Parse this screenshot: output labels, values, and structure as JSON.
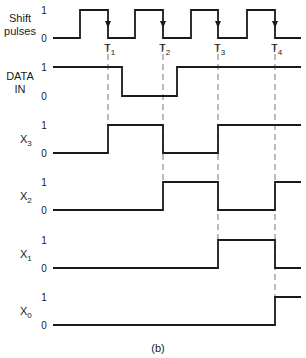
{
  "figure": {
    "caption": "(b)",
    "time_markers": [
      {
        "label": "T",
        "sub": "1",
        "x": 108
      },
      {
        "label": "T",
        "sub": "2",
        "x": 163
      },
      {
        "label": "T",
        "sub": "3",
        "x": 218
      },
      {
        "label": "T",
        "sub": "4",
        "x": 275
      }
    ],
    "x_start": 53,
    "x_end": 301,
    "signals": [
      {
        "id": "shift-pulses",
        "label_lines": [
          "Shift",
          "pulses"
        ],
        "sub": "",
        "high_y": 10,
        "low_y": 38,
        "initial": 0,
        "transitions": [
          80,
          108,
          135,
          163,
          191,
          218,
          247,
          275
        ],
        "level_one": "1",
        "level_zero": "0",
        "arrows_at": [
          108,
          163,
          218,
          275
        ]
      },
      {
        "id": "data-in",
        "label_lines": [
          "DATA",
          "IN"
        ],
        "sub": "",
        "high_y": 67,
        "low_y": 96,
        "initial": 1,
        "transitions": [
          122,
          177
        ],
        "level_one": "1",
        "level_zero": "0"
      },
      {
        "id": "x3",
        "label_lines": [
          "X"
        ],
        "sub": "3",
        "high_y": 125,
        "low_y": 153,
        "initial": 0,
        "transitions": [
          108,
          163,
          218
        ],
        "level_one": "1",
        "level_zero": "0"
      },
      {
        "id": "x2",
        "label_lines": [
          "X"
        ],
        "sub": "2",
        "high_y": 182,
        "low_y": 210,
        "initial": 0,
        "transitions": [
          163,
          218,
          275
        ],
        "level_one": "1",
        "level_zero": "0"
      },
      {
        "id": "x1",
        "label_lines": [
          "X"
        ],
        "sub": "1",
        "high_y": 240,
        "low_y": 268,
        "initial": 0,
        "transitions": [
          218,
          275
        ],
        "level_one": "1",
        "level_zero": "0"
      },
      {
        "id": "x0",
        "label_lines": [
          "X"
        ],
        "sub": "0",
        "high_y": 297,
        "low_y": 325,
        "initial": 0,
        "transitions": [
          275
        ],
        "level_one": "1",
        "level_zero": "0"
      }
    ],
    "dashed_guides": [
      {
        "x": 108,
        "y1": 44,
        "y2": 125
      },
      {
        "x": 163,
        "y1": 44,
        "y2": 182
      },
      {
        "x": 218,
        "y1": 44,
        "y2": 240
      },
      {
        "x": 275,
        "y1": 44,
        "y2": 297
      }
    ]
  }
}
